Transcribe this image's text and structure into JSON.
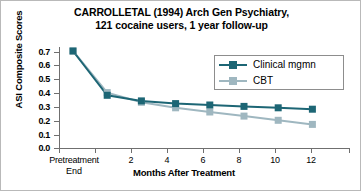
{
  "figure": {
    "title_line1": "CARROLLETAL (1994) Arch Gen Psychiatry,",
    "title_line2": "121 cocaine users, 1 year follow-up"
  },
  "colors": {
    "clinical_mgmn": "#1d6675",
    "cbt": "#9fb7c0",
    "axis": "#6f6f6f",
    "frame": "#b9b9b9",
    "background": "#ffffff"
  },
  "chart_data": {
    "type": "line",
    "title": "CARROLLETAL (1994) Arch Gen Psychiatry, 121 cocaine users, 1 year follow-up",
    "xlabel": "Months After Treatment",
    "ylabel": "ASI Composite Scores",
    "x": [
      0,
      2,
      4,
      6,
      8,
      10,
      12,
      14
    ],
    "x_tick_labels": [
      "Pretreatment",
      "2",
      "4",
      "6",
      "8",
      "10",
      "12"
    ],
    "x_tick_sublabel": "End",
    "y_tick_labels": [
      "0.7",
      "0.6",
      "0.5",
      "0.4",
      "0.3",
      "0.2",
      "0.1",
      "0.0"
    ],
    "ylim": [
      0.0,
      0.7
    ],
    "grid": false,
    "legend_position": "upper right",
    "series": [
      {
        "name": "Clinical mgmn",
        "color": "#1d6675",
        "values": [
          0.7,
          0.38,
          0.34,
          0.32,
          0.31,
          0.3,
          0.29,
          0.28
        ]
      },
      {
        "name": "CBT",
        "color": "#9fb7c0",
        "values": [
          0.7,
          0.4,
          0.33,
          0.29,
          0.26,
          0.23,
          0.2,
          0.17
        ]
      }
    ]
  }
}
